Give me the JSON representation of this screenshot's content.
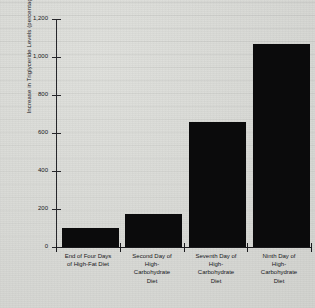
{
  "chart_data": {
    "type": "bar",
    "title": "",
    "xlabel": "",
    "ylabel": "Increase in Triglyceride Levels (percentage)",
    "categories": [
      "End of Four Days of High-Fat Diet",
      "Second Day of High-Carbohydrate Diet",
      "Seventh Day of High-Carbohydrate Diet",
      "Ninth Day of High-Carbohydrate Diet"
    ],
    "category_lines": [
      [
        "End of Four Days",
        "of High-Fat Diet"
      ],
      [
        "Second Day of",
        "High-",
        "Carbohydrate",
        "Diet"
      ],
      [
        "Seventh Day of",
        "High-",
        "Carbohydrate",
        "Diet"
      ],
      [
        "Ninth Day of",
        "High-",
        "Carbohydrate",
        "Diet"
      ]
    ],
    "values": [
      100,
      175,
      660,
      1070
    ],
    "ylim": [
      0,
      1200
    ],
    "ytick_values": [
      0,
      200,
      400,
      600,
      800,
      1000,
      1200
    ],
    "ytick_labels": [
      "0",
      "200",
      "400",
      "600",
      "800",
      "1,000",
      "1,200"
    ],
    "grid": false,
    "legend": false,
    "bar_color": "#0b0b0c",
    "background_color": "#d9d9d6",
    "axis_color": "#1a1a1d"
  }
}
